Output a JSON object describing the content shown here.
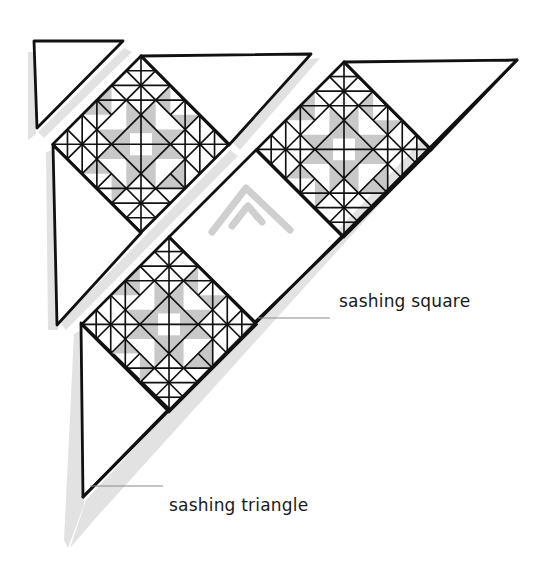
{
  "diagram": {
    "colors": {
      "outline": "#111111",
      "block_fill": "#ffffff",
      "shaded_patch": "#c8c8c8",
      "shadow": "#d9d9d9",
      "leader_line": "#8a8a8a"
    },
    "labels": {
      "sashing_square": "sashing square",
      "sashing_triangle": "sashing triangle"
    },
    "strips": [
      {
        "name": "upper-left strip",
        "pieces": [
          "corner triangle",
          "pieced block",
          "top setting triangle",
          "left setting triangle"
        ]
      },
      {
        "name": "main diagonal strip",
        "pieces": [
          "pieced block",
          "top setting triangle",
          "sashing square",
          "pieced block",
          "sashing triangle"
        ]
      }
    ],
    "block_count": 3
  }
}
